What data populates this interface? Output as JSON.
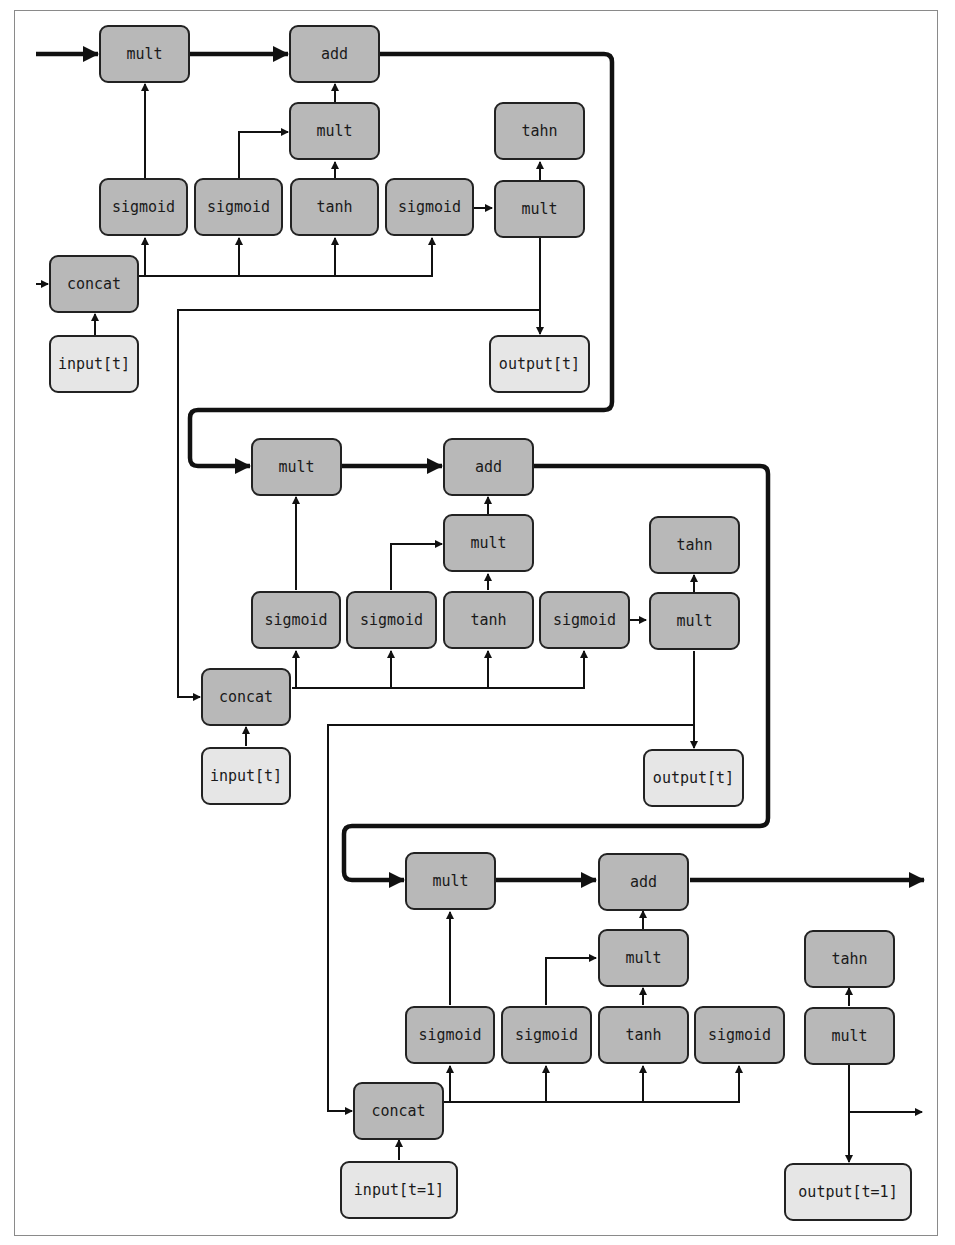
{
  "diagram": {
    "type": "LSTM unrolled computation graph (3 time steps)",
    "colors": {
      "op_node": "#b8b8b8",
      "io_node": "#e6e6e6",
      "edge": "#111111",
      "border": "#222222"
    },
    "cells": [
      {
        "id": "cell1",
        "nodes": {
          "mult_top": "mult",
          "add": "add",
          "mult_mid": "mult",
          "tahn": "tahn",
          "sigmoid1": "sigmoid",
          "sigmoid2": "sigmoid",
          "tanh": "tanh",
          "sigmoid3": "sigmoid",
          "mult_out": "mult",
          "concat": "concat",
          "input": "input[t]",
          "output": "output[t]"
        }
      },
      {
        "id": "cell2",
        "nodes": {
          "mult_top": "mult",
          "add": "add",
          "mult_mid": "mult",
          "tahn": "tahn",
          "sigmoid1": "sigmoid",
          "sigmoid2": "sigmoid",
          "tanh": "tanh",
          "sigmoid3": "sigmoid",
          "mult_out": "mult",
          "concat": "concat",
          "input": "input[t]",
          "output": "output[t]"
        }
      },
      {
        "id": "cell3",
        "nodes": {
          "mult_top": "mult",
          "add": "add",
          "mult_mid": "mult",
          "tahn": "tahn",
          "sigmoid1": "sigmoid",
          "sigmoid2": "sigmoid",
          "tanh": "tanh",
          "sigmoid3": "sigmoid",
          "mult_out": "mult",
          "concat": "concat",
          "input": "input[t=1]",
          "output": "output[t=1]"
        }
      }
    ]
  }
}
